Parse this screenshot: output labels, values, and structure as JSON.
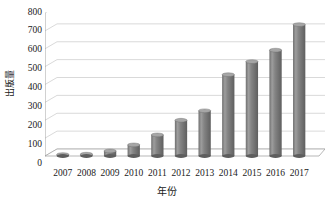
{
  "chart_data": {
    "type": "bar",
    "title": "",
    "subtitle": "",
    "xlabel": "年份",
    "ylabel": "出版量",
    "categories": [
      "2007",
      "2008",
      "2009",
      "2010",
      "2011",
      "2012",
      "2013",
      "2014",
      "2015",
      "2016",
      "2017"
    ],
    "values": [
      8,
      10,
      28,
      62,
      118,
      200,
      253,
      455,
      528,
      592,
      735
    ],
    "series": [
      {
        "name": "出版量",
        "values": [
          8,
          10,
          28,
          62,
          118,
          200,
          253,
          455,
          528,
          592,
          735
        ]
      }
    ],
    "ylim": [
      0,
      800
    ],
    "ytick_step": 100,
    "yticks": [
      "800",
      "700",
      "600",
      "500",
      "400",
      "300",
      "200",
      "100",
      "0"
    ],
    "ytick_values": [
      800,
      700,
      600,
      500,
      400,
      300,
      200,
      100,
      0
    ],
    "grid": true,
    "grid_axis": "y",
    "legend": false,
    "legend_position": "none",
    "style": "3d-cylinder-columns",
    "colors": {
      "bar_fill": "#7f7f7f",
      "bar_highlight": "#a6a6a6",
      "bar_shadow": "#5e5e5e",
      "grid_line": "#c9c9c9",
      "axis_line": "#9a9a9a",
      "background": "#ffffff",
      "text": "#1a1a1a"
    }
  }
}
